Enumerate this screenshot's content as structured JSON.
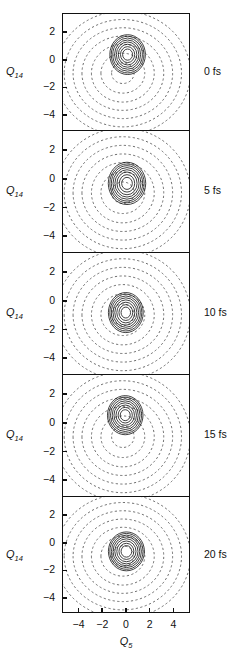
{
  "figure": {
    "axis_labels": {
      "y": "Q",
      "y_sub": "14",
      "x": "Q",
      "x_sub": "5"
    },
    "y_ticks": [
      "2",
      "0",
      "-2",
      "-4"
    ],
    "x_ticks": [
      "-4",
      "-2",
      "0",
      "2",
      "4"
    ],
    "time_labels": [
      "0 fs",
      "5 fs",
      "10 fs",
      "15 fs",
      "20 fs"
    ],
    "colors": {
      "axis": "#111111",
      "potential_contour": "#555555",
      "wavepacket_contour": "#111111",
      "background": "#ffffff"
    }
  },
  "chart_data": {
    "type": "line",
    "title": "",
    "xlabel": "Q_5",
    "ylabel": "Q_14",
    "xlim": [
      -5.4,
      5.4
    ],
    "ylim": [
      -5.1,
      3.4
    ],
    "grid": false,
    "legend": null,
    "x_ticks": [
      -4,
      -2,
      0,
      2,
      4
    ],
    "y_ticks": [
      2,
      0,
      -2,
      -4
    ],
    "panels": [
      {
        "time_label": "0 fs",
        "time_fs": 0,
        "potential_center": [
          -0.35,
          -0.9
        ],
        "potential_rx": [
          0.95,
          1.85,
          2.65,
          3.45,
          4.2,
          4.95,
          5.7
        ],
        "potential_ry": [
          0.75,
          1.45,
          2.1,
          2.7,
          3.3,
          3.9,
          4.5
        ],
        "potential_contour_count": 7,
        "potential_style": "dashed",
        "wavepacket_center": [
          0.05,
          0.45
        ],
        "wavepacket_radii": [
          0.42,
          0.6,
          0.78,
          0.95,
          1.1,
          1.25,
          1.38,
          1.5
        ],
        "wavepacket_rx_scale": 1.0,
        "wavepacket_ry_scale": 1.12,
        "wavepacket_contour_count": 8,
        "wavepacket_style": "solid"
      },
      {
        "time_label": "5 fs",
        "time_fs": 5,
        "potential_center": [
          -0.35,
          -0.9
        ],
        "potential_rx": [
          0.95,
          1.85,
          2.65,
          3.45,
          4.2,
          4.95,
          5.7
        ],
        "potential_ry": [
          0.75,
          1.45,
          2.1,
          2.7,
          3.3,
          3.9,
          4.5
        ],
        "potential_contour_count": 7,
        "potential_style": "dashed",
        "wavepacket_center": [
          0.0,
          -0.25
        ],
        "wavepacket_radii": [
          0.45,
          0.65,
          0.85,
          1.02,
          1.18,
          1.32,
          1.45,
          1.58
        ],
        "wavepacket_rx_scale": 1.0,
        "wavepacket_ry_scale": 1.13,
        "wavepacket_contour_count": 8,
        "wavepacket_style": "solid"
      },
      {
        "time_label": "10 fs",
        "time_fs": 10,
        "potential_center": [
          -0.35,
          -0.9
        ],
        "potential_rx": [
          0.95,
          1.85,
          2.65,
          3.45,
          4.2,
          4.95,
          5.7
        ],
        "potential_ry": [
          0.75,
          1.45,
          2.1,
          2.7,
          3.3,
          3.9,
          4.5
        ],
        "potential_contour_count": 7,
        "potential_style": "dashed",
        "wavepacket_center": [
          -0.1,
          -0.75
        ],
        "wavepacket_radii": [
          0.4,
          0.58,
          0.76,
          0.93,
          1.08,
          1.22,
          1.35,
          1.47
        ],
        "wavepacket_rx_scale": 1.0,
        "wavepacket_ry_scale": 1.15,
        "wavepacket_contour_count": 8,
        "wavepacket_style": "solid"
      },
      {
        "time_label": "15 fs",
        "time_fs": 15,
        "potential_center": [
          -0.35,
          -0.9
        ],
        "potential_rx": [
          0.95,
          1.85,
          2.65,
          3.45,
          4.2,
          4.95,
          5.7
        ],
        "potential_ry": [
          0.75,
          1.45,
          2.1,
          2.7,
          3.3,
          3.9,
          4.5
        ],
        "potential_contour_count": 7,
        "potential_style": "dashed",
        "wavepacket_center": [
          -0.15,
          0.6
        ],
        "wavepacket_radii": [
          0.42,
          0.6,
          0.78,
          0.95,
          1.1,
          1.25,
          1.38,
          1.5
        ],
        "wavepacket_rx_scale": 1.0,
        "wavepacket_ry_scale": 1.1,
        "wavepacket_contour_count": 8,
        "wavepacket_style": "solid"
      },
      {
        "time_label": "20 fs",
        "time_fs": 20,
        "potential_center": [
          -0.35,
          -0.9
        ],
        "potential_rx": [
          0.95,
          1.85,
          2.65,
          3.45,
          4.2,
          4.95,
          5.7
        ],
        "potential_ry": [
          0.75,
          1.45,
          2.1,
          2.7,
          3.3,
          3.9,
          4.5
        ],
        "potential_contour_count": 7,
        "potential_style": "dashed",
        "wavepacket_center": [
          -0.05,
          -0.55
        ],
        "wavepacket_radii": [
          0.45,
          0.63,
          0.81,
          0.98,
          1.13,
          1.27,
          1.4,
          1.52
        ],
        "wavepacket_rx_scale": 1.0,
        "wavepacket_ry_scale": 1.08,
        "wavepacket_contour_count": 8,
        "wavepacket_style": "solid"
      }
    ]
  }
}
